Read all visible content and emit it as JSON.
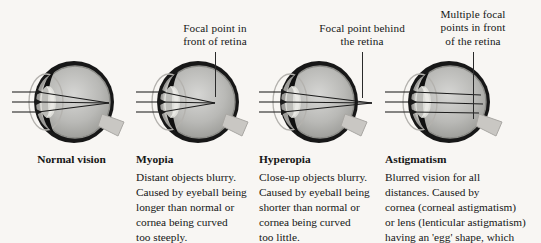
{
  "figure": {
    "background_color": "#f8f6f3",
    "ink_color": "#161616"
  },
  "callouts": [
    {
      "id": "myopia-callout",
      "text": "Focal point in\nfront of retina"
    },
    {
      "id": "hyperopia-callout",
      "text": "Focal point behind\nthe retina"
    },
    {
      "id": "astigmatism-callout",
      "text": "Multiple focal\npoints in front\nof the retina"
    }
  ],
  "columns": [
    {
      "id": "normal-vision",
      "heading": "Normal vision",
      "body": ""
    },
    {
      "id": "myopia",
      "heading": "Myopia",
      "body": "Distant objects blurry.\nCaused by eyeball being\nlonger than normal or\ncornea being curved\ntoo steeply."
    },
    {
      "id": "hyperopia",
      "heading": "Hyperopia",
      "body": "Close-up objects blurry.\nCaused by eyeball being\nshorter than normal or\ncornea being curved\ntoo little."
    },
    {
      "id": "astigmatism",
      "heading": "Astigmatism",
      "body": "Blurred vision for all\ndistances. Caused by\ncornea (corneal astigmatism)\nor lens (lenticular astigmatism)\nhaving an 'egg' shape, which"
    }
  ],
  "diagrams": [
    {
      "id": "eye-normal-vision",
      "label": "normal vision eye cross-section",
      "ray_count": 3,
      "focus": "on-retina"
    },
    {
      "id": "eye-myopia",
      "label": "myopia eye cross-section",
      "ray_count": 3,
      "focus": "in-front-of-retina"
    },
    {
      "id": "eye-hyperopia",
      "label": "hyperopia eye cross-section",
      "ray_count": 3,
      "focus": "behind-retina"
    },
    {
      "id": "eye-astigmatism",
      "label": "astigmatism eye cross-section",
      "ray_count": 3,
      "focus": "multiple-points"
    }
  ]
}
